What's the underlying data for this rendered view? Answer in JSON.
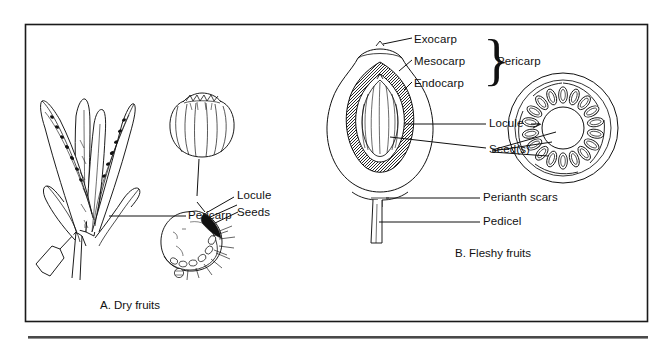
{
  "figure": {
    "border_color": "#1a1a1a",
    "ink_color": "#111111",
    "background_color": "#ffffff",
    "rule_color": "#4a4a4a"
  },
  "panel_a": {
    "caption": "A. Dry fruits",
    "labels": {
      "pericarp": "Pericarp",
      "locule": "Locule",
      "seeds": "Seeds"
    },
    "specimens": [
      {
        "name": "dehiscent-pod-cluster",
        "description": "cluster of splayed dry pods on a stem showing seeds"
      },
      {
        "name": "ribbed-capsule",
        "description": "rounded ribbed capsule with toothed crown"
      },
      {
        "name": "bristly-achene",
        "description": "rounded dry fruit with dark locule wedge, seeds and bristles"
      }
    ]
  },
  "panel_b": {
    "caption": "B. Fleshy fruits",
    "labels": {
      "exocarp": "Exocarp",
      "mesocarp": "Mesocarp",
      "endocarp": "Endocarp",
      "pericarp": "Pericarp",
      "locule": "Locule",
      "seeds": "Seed(s)",
      "perianth_scars": "Perianth scars",
      "pedicel": "Pedicel"
    },
    "brace_glyph": "}",
    "specimens": [
      {
        "name": "drupe-longitudinal-section",
        "description": "ovoid fleshy fruit cut lengthwise showing exocarp, mesocarp, hatched endocarp, striated seed and pedicel"
      },
      {
        "name": "berry-cross-section",
        "description": "circular cross-section with ring of radial seeds around a central locule"
      }
    ]
  }
}
